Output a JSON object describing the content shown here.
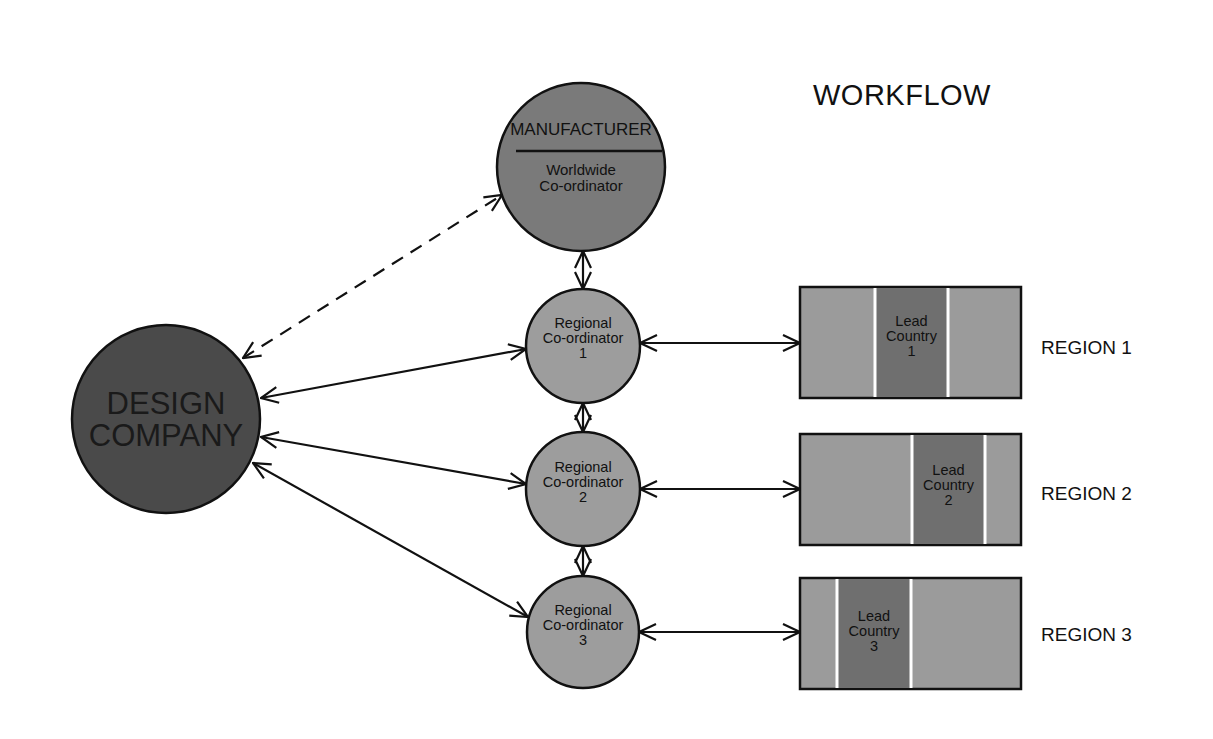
{
  "title": "WORKFLOW",
  "colors": {
    "background": "#ffffff",
    "design_company_fill": "#4a4a4a",
    "manufacturer_fill": "#7a7a7a",
    "coordinator_fill": "#9d9d9d",
    "region_fill": "#9b9b9b",
    "lead_country_fill": "#6f6f6f",
    "stroke": "#111111"
  },
  "nodes": {
    "manufacturer": {
      "title": "MANUFACTURER",
      "subtitle_line1": "Worldwide",
      "subtitle_line2": "Co-ordinator"
    },
    "design_company": {
      "line1": "DESIGN",
      "line2": "COMPANY"
    },
    "coordinators": [
      {
        "line1": "Regional",
        "line2": "Co-ordinator",
        "number": "1"
      },
      {
        "line1": "Regional",
        "line2": "Co-ordinator",
        "number": "2"
      },
      {
        "line1": "Regional",
        "line2": "Co-ordinator",
        "number": "3"
      }
    ],
    "regions": [
      {
        "label": "REGION 1",
        "lead_line1": "Lead",
        "lead_line2": "Country",
        "lead_number": "1"
      },
      {
        "label": "REGION 2",
        "lead_line1": "Lead",
        "lead_line2": "Country",
        "lead_number": "2"
      },
      {
        "label": "REGION 3",
        "lead_line1": "Lead",
        "lead_line2": "Country",
        "lead_number": "3"
      }
    ]
  },
  "edges": [
    {
      "from": "DESIGN COMPANY",
      "to": "MANUFACTURER",
      "style": "dashed",
      "direction": "bidirectional"
    },
    {
      "from": "DESIGN COMPANY",
      "to": "Regional Co-ordinator 1",
      "style": "solid",
      "direction": "bidirectional"
    },
    {
      "from": "DESIGN COMPANY",
      "to": "Regional Co-ordinator 2",
      "style": "solid",
      "direction": "bidirectional"
    },
    {
      "from": "DESIGN COMPANY",
      "to": "Regional Co-ordinator 3",
      "style": "solid",
      "direction": "bidirectional"
    },
    {
      "from": "MANUFACTURER",
      "to": "Regional Co-ordinator 1",
      "style": "solid",
      "direction": "bidirectional"
    },
    {
      "from": "Regional Co-ordinator 1",
      "to": "Regional Co-ordinator 2",
      "style": "solid",
      "direction": "bidirectional"
    },
    {
      "from": "Regional Co-ordinator 2",
      "to": "Regional Co-ordinator 3",
      "style": "solid",
      "direction": "bidirectional"
    },
    {
      "from": "Regional Co-ordinator 1",
      "to": "REGION 1",
      "style": "solid",
      "direction": "bidirectional"
    },
    {
      "from": "Regional Co-ordinator 2",
      "to": "REGION 2",
      "style": "solid",
      "direction": "bidirectional"
    },
    {
      "from": "Regional Co-ordinator 3",
      "to": "REGION 3",
      "style": "solid",
      "direction": "bidirectional"
    }
  ]
}
